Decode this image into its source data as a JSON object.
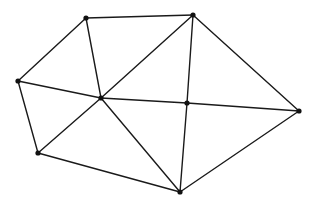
{
  "diagram": {
    "type": "planar-graph-triangulation",
    "background": "#ffffff",
    "edge_color": "#1a1a1a",
    "node_color": "#111111",
    "node_radius": 2.6,
    "nodes": [
      {
        "id": "A",
        "x": 86,
        "y": 18
      },
      {
        "id": "B",
        "x": 193,
        "y": 15
      },
      {
        "id": "L",
        "x": 18,
        "y": 81
      },
      {
        "id": "C",
        "x": 101,
        "y": 98
      },
      {
        "id": "M",
        "x": 187,
        "y": 103
      },
      {
        "id": "R",
        "x": 299,
        "y": 111
      },
      {
        "id": "BL",
        "x": 38,
        "y": 153
      },
      {
        "id": "BOT",
        "x": 180,
        "y": 192
      }
    ],
    "edges": [
      [
        "A",
        "B"
      ],
      [
        "A",
        "L"
      ],
      [
        "A",
        "C"
      ],
      [
        "B",
        "C"
      ],
      [
        "B",
        "M"
      ],
      [
        "B",
        "R"
      ],
      [
        "L",
        "C"
      ],
      [
        "L",
        "BL"
      ],
      [
        "C",
        "M"
      ],
      [
        "M",
        "R"
      ],
      [
        "C",
        "BL"
      ],
      [
        "C",
        "BOT"
      ],
      [
        "BL",
        "BOT"
      ],
      [
        "M",
        "BOT"
      ],
      [
        "R",
        "BOT"
      ]
    ]
  }
}
